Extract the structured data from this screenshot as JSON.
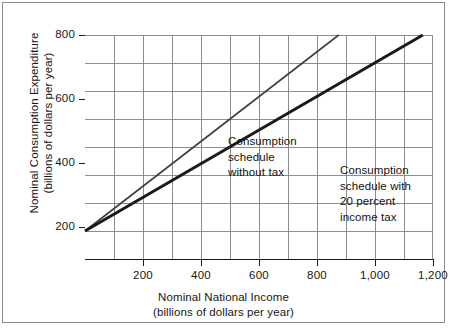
{
  "figure": {
    "background": "#ffffff",
    "frame_color": "#8d8d8d",
    "axis_color": "#1a1a1a",
    "grid_color": "#8d8d8d"
  },
  "chart_data": {
    "type": "line",
    "title": "",
    "xlabel": "Nominal National Income",
    "xlabel_units": "(billions of dollars per year)",
    "ylabel": "Nominal Consumption Expenditure",
    "ylabel_units": "(billions of dollars per year)",
    "xlim": [
      0,
      1200
    ],
    "ylim": [
      0,
      800
    ],
    "xticks": [
      200,
      400,
      600,
      800,
      1000,
      1200
    ],
    "xticklabels": [
      "200",
      "400",
      "600",
      "800",
      "1,000",
      "1,200"
    ],
    "yticks": [
      200,
      400,
      600,
      800
    ],
    "yticklabels": [
      "200",
      "400",
      "600",
      "800"
    ],
    "grid": true,
    "grid_x_step": 100,
    "grid_y_step": 100,
    "legend": "annotations",
    "series": [
      {
        "name": "Consumption schedule without tax",
        "annotation": [
          "Consumption",
          "schedule",
          "without tax"
        ],
        "color": "#3f3f3f",
        "line_width": 1.6,
        "intercept": 100,
        "slope": 0.8,
        "x": [
          0,
          875
        ],
        "values": [
          100,
          800
        ]
      },
      {
        "name": "Consumption schedule with 20 percent income tax",
        "annotation": [
          "Consumption",
          "schedule with",
          "20 percent",
          "income tax"
        ],
        "color": "#1a1a1a",
        "line_width": 3.0,
        "intercept": 100,
        "slope": 0.6,
        "x": [
          0,
          1165
        ],
        "values": [
          100,
          800
        ]
      }
    ]
  }
}
